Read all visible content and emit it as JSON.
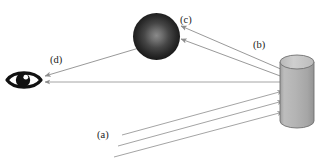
{
  "figure": {
    "background_color": "#ffffff",
    "width": 332,
    "height": 163
  },
  "labels": [
    {
      "id": "a",
      "text": "(a)",
      "x": 97,
      "y": 130,
      "meaning": "incident-light-rays"
    },
    {
      "id": "b",
      "text": "(b)",
      "x": 253,
      "y": 40,
      "meaning": "reflected-rays-to-sphere"
    },
    {
      "id": "c",
      "text": "(c)",
      "x": 180,
      "y": 15,
      "meaning": "rays-arriving-at-sphere"
    },
    {
      "id": "d",
      "text": "(d)",
      "x": 50,
      "y": 55,
      "meaning": "ray-to-eye"
    }
  ],
  "objects": {
    "sphere": {
      "name": "dark-sphere",
      "cx": 156.5,
      "cy": 36.5,
      "r": 23.5,
      "center_color": "#7a7a7a",
      "edge_color": "#1c1c1c"
    },
    "cylinder": {
      "name": "gray-cylinder",
      "x": 280,
      "y": 55,
      "width": 34,
      "height": 73,
      "body_color": "#b0b0b0",
      "top_color": "#c8c8c8",
      "outline_color": "#6b6b6b",
      "top_ellipse_ry": 7
    },
    "eye": {
      "name": "eye-symbol",
      "cx": 24,
      "cy": 80,
      "width": 34,
      "height": 18,
      "outline_color": "#111111",
      "pupil_color": "#111111",
      "sclera_color": "#ffffff"
    }
  },
  "rays": {
    "incident": {
      "label": "a",
      "count": 3,
      "color": "#9a9a9a",
      "direction": "up-right",
      "paths": [
        {
          "x1": 122,
          "y1": 135,
          "x2": 283,
          "y2": 91
        },
        {
          "x1": 118,
          "y1": 146,
          "x2": 283,
          "y2": 101
        },
        {
          "x1": 114,
          "y1": 157,
          "x2": 283,
          "y2": 112
        }
      ]
    },
    "to_sphere": {
      "label": "b",
      "count": 2,
      "color": "#8d8d8d",
      "direction": "up-left",
      "paths": [
        {
          "x1": 282,
          "y1": 70,
          "x2": 180,
          "y2": 26
        },
        {
          "x1": 282,
          "y1": 76,
          "x2": 180,
          "y2": 39
        }
      ]
    },
    "to_eye_direct": {
      "color": "#8d8d8d",
      "direction": "left",
      "paths": [
        {
          "x1": 280,
          "y1": 82,
          "x2": 45,
          "y2": 82
        }
      ]
    },
    "sphere_to_eye": {
      "label": "d",
      "color": "#8d8d8d",
      "direction": "down-left",
      "paths": [
        {
          "x1": 138,
          "y1": 48,
          "x2": 45,
          "y2": 76
        }
      ]
    }
  }
}
